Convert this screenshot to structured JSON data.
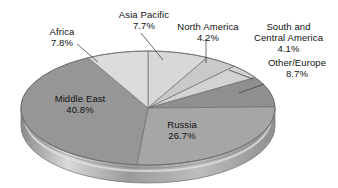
{
  "chart_data": {
    "type": "pie",
    "title": "",
    "subtitle": "",
    "xlabel": "",
    "ylabel": "",
    "legend": "none",
    "grid": false,
    "units": "percent",
    "categories": [
      "Asia Pacific",
      "North America",
      "South and Central America",
      "Other/Europe",
      "Russia",
      "Middle East",
      "Africa"
    ],
    "values": [
      7.7,
      4.2,
      4.1,
      8.7,
      26.7,
      40.8,
      7.8
    ],
    "slices": [
      {
        "label": "Asia Pacific",
        "pct_text": "7.7%",
        "value": 7.7,
        "color": "#d8d8d8",
        "side_color": "#bcbcbc",
        "label_position": "outside-top-left"
      },
      {
        "label": "North America",
        "pct_text": "4.2%",
        "value": 4.2,
        "color": "#c9c9c9",
        "side_color": "#adadad",
        "label_position": "outside-top"
      },
      {
        "label": "South and Central America",
        "pct_text": "4.1%",
        "value": 4.1,
        "color": "#d2d2d2",
        "side_color": "#b6b6b6",
        "label_position": "outside-top-right"
      },
      {
        "label": "Other/Europe",
        "pct_text": "8.7%",
        "value": 8.7,
        "color": "#8f8f8f",
        "side_color": "#767676",
        "label_position": "outside-right"
      },
      {
        "label": "Russia",
        "pct_text": "26.7%",
        "value": 26.7,
        "color": "#a6a6a6",
        "side_color": "#8b8b8b",
        "label_position": "inside"
      },
      {
        "label": "Middle East",
        "pct_text": "40.8%",
        "value": 40.8,
        "color": "#969696",
        "side_color": "#7d7d7d",
        "label_position": "inside"
      },
      {
        "label": "Africa",
        "pct_text": "7.8%",
        "value": 7.8,
        "color": "#dcdcdc",
        "side_color": "#c0c0c0",
        "label_position": "outside-top-left"
      }
    ],
    "colors": {
      "background": "#ffffff",
      "text": "#111111",
      "leader_line": "#4a4a4a",
      "slice_edge": "#6e6e6e"
    }
  },
  "labels": {
    "africa": {
      "name": "Africa",
      "pct": "7.8%"
    },
    "asia_pacific": {
      "name": "Asia Pacific",
      "pct": "7.7%"
    },
    "north_america": {
      "name": "North America",
      "pct": "4.2%"
    },
    "south_central_america": {
      "name_line1": "South and",
      "name_line2": "Central America",
      "pct": "4.1%"
    },
    "other_europe": {
      "name": "Other/Europe",
      "pct": "8.7%"
    },
    "middle_east": {
      "name": "Middle East",
      "pct": "40.8%"
    },
    "russia": {
      "name": "Russia",
      "pct": "26.7%"
    }
  }
}
